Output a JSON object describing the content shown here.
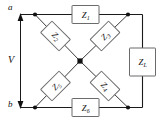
{
  "figure": {
    "kind": "lattice-bridge-circuit",
    "width": 161,
    "height": 122,
    "background": "#ffffff",
    "wire_color": "#1a1a1a",
    "component_border": "#6b6b6b",
    "node_color": "#111111"
  },
  "terminals": {
    "top": "a",
    "bottom": "b"
  },
  "source": {
    "label": "V",
    "arrow_style": "double-headed-vertical"
  },
  "components": {
    "top_series": {
      "label": "Z",
      "sub": "1"
    },
    "bottom_series": {
      "label": "Z",
      "sub": "6"
    },
    "load": {
      "label": "Z",
      "sub": "L"
    },
    "diag_upper_left": {
      "label": "Z",
      "sub": "2"
    },
    "diag_upper_right": {
      "label": "Z",
      "sub": "3"
    },
    "diag_lower_left": {
      "label": "Z",
      "sub": "5"
    },
    "diag_lower_right": {
      "label": "Z",
      "sub": "4"
    }
  },
  "nodes": {
    "top_left": "junction",
    "top_right": "junction",
    "bottom_left": "junction",
    "bottom_right": "junction",
    "center": "junction"
  }
}
